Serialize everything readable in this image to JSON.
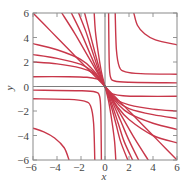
{
  "chart_data": {
    "type": "line",
    "title": "",
    "xlabel": "x",
    "ylabel": "y",
    "xlim": [
      -6,
      6
    ],
    "ylim": [
      -6,
      6
    ],
    "xticks": [
      -6,
      -4,
      -2,
      0,
      2,
      4,
      6
    ],
    "yticks": [
      -6,
      -4,
      -2,
      0,
      2,
      4,
      6
    ],
    "xtick_labels": [
      "−6",
      "−4",
      "−2",
      "0",
      "2",
      "4",
      "6"
    ],
    "ytick_labels": [
      "−6",
      "−4",
      "−2",
      "0",
      "2",
      "4",
      "6"
    ],
    "grid": false,
    "curve_color": "#c8374a",
    "axis_color": "#6e6e6e",
    "series": [
      {
        "name": "fan-q4-1",
        "points": [
          [
            0,
            0
          ],
          [
            0.3,
            -0.45
          ],
          [
            0.6,
            -0.6
          ],
          [
            1.5,
            -0.75
          ],
          [
            3,
            -0.8
          ],
          [
            6,
            -0.8
          ]
        ]
      },
      {
        "name": "fan-q4-2",
        "points": [
          [
            0,
            0
          ],
          [
            0.4,
            -0.5
          ],
          [
            1,
            -1.1
          ],
          [
            2,
            -1.5
          ],
          [
            4,
            -1.85
          ],
          [
            6,
            -2.0
          ]
        ]
      },
      {
        "name": "fan-q4-3",
        "points": [
          [
            0,
            0
          ],
          [
            0.4,
            -0.55
          ],
          [
            1,
            -1.2
          ],
          [
            2,
            -1.8
          ],
          [
            4,
            -2.3
          ],
          [
            6,
            -2.6
          ]
        ]
      },
      {
        "name": "fan-q4-4",
        "points": [
          [
            0,
            0
          ],
          [
            0.4,
            -0.6
          ],
          [
            1,
            -1.35
          ],
          [
            2,
            -2.2
          ],
          [
            4,
            -3.0
          ],
          [
            6,
            -3.5
          ]
        ]
      },
      {
        "name": "fan-q4-5",
        "points": [
          [
            0,
            0
          ],
          [
            0.5,
            -0.8
          ],
          [
            1,
            -1.6
          ],
          [
            2,
            -2.7
          ],
          [
            4,
            -4.0
          ],
          [
            6,
            -4.6
          ]
        ]
      },
      {
        "name": "fan-q4-6",
        "points": [
          [
            0,
            0
          ],
          [
            1,
            -1
          ],
          [
            2,
            -2
          ],
          [
            3,
            -3
          ],
          [
            4.5,
            -4.5
          ],
          [
            6,
            -6
          ]
        ]
      },
      {
        "name": "fan-q4-7",
        "points": [
          [
            0,
            0
          ],
          [
            0.5,
            -0.9
          ],
          [
            1.5,
            -2.6
          ],
          [
            2.5,
            -4.3
          ],
          [
            3.6,
            -6
          ]
        ]
      },
      {
        "name": "fan-q4-8",
        "points": [
          [
            0,
            0
          ],
          [
            0.5,
            -1.0
          ],
          [
            1.3,
            -2.8
          ],
          [
            2.0,
            -4.4
          ],
          [
            2.8,
            -6
          ]
        ]
      },
      {
        "name": "fan-q4-9",
        "points": [
          [
            0,
            0
          ],
          [
            0.45,
            -1.1
          ],
          [
            1.1,
            -3.0
          ],
          [
            1.6,
            -4.5
          ],
          [
            2.3,
            -6
          ]
        ]
      },
      {
        "name": "fan-q4-10",
        "points": [
          [
            0,
            0
          ],
          [
            0.4,
            -1.2
          ],
          [
            0.9,
            -3.0
          ],
          [
            1.3,
            -4.5
          ],
          [
            1.9,
            -6
          ]
        ]
      },
      {
        "name": "fan-q4-11",
        "points": [
          [
            0,
            0
          ],
          [
            0.3,
            -1.2
          ],
          [
            0.6,
            -3.0
          ],
          [
            0.8,
            -4.5
          ],
          [
            0.9,
            -6
          ]
        ]
      },
      {
        "name": "fan-q2-1",
        "points": [
          [
            0,
            0
          ],
          [
            -0.3,
            0.45
          ],
          [
            -0.6,
            0.6
          ],
          [
            -1.5,
            0.75
          ],
          [
            -3,
            0.8
          ],
          [
            -6,
            0.8
          ]
        ]
      },
      {
        "name": "fan-q2-2",
        "points": [
          [
            0,
            0
          ],
          [
            -0.4,
            0.5
          ],
          [
            -1,
            1.1
          ],
          [
            -2,
            1.5
          ],
          [
            -4,
            1.85
          ],
          [
            -6,
            2.0
          ]
        ]
      },
      {
        "name": "fan-q2-3",
        "points": [
          [
            0,
            0
          ],
          [
            -0.4,
            0.55
          ],
          [
            -1,
            1.2
          ],
          [
            -2,
            1.8
          ],
          [
            -4,
            2.3
          ],
          [
            -6,
            2.6
          ]
        ]
      },
      {
        "name": "fan-q2-4",
        "points": [
          [
            0,
            0
          ],
          [
            -0.4,
            0.6
          ],
          [
            -1,
            1.35
          ],
          [
            -2,
            2.2
          ],
          [
            -4,
            3.0
          ],
          [
            -6,
            3.5
          ]
        ]
      },
      {
        "name": "fan-q2-5",
        "points": [
          [
            0,
            0
          ],
          [
            -1,
            1
          ],
          [
            -2,
            2
          ],
          [
            -3,
            3
          ],
          [
            -4.5,
            4.5
          ],
          [
            -6,
            6
          ]
        ]
      },
      {
        "name": "fan-q2-6",
        "points": [
          [
            0,
            0
          ],
          [
            -0.5,
            0.9
          ],
          [
            -1.5,
            2.6
          ],
          [
            -2.5,
            4.3
          ],
          [
            -3.6,
            6
          ]
        ]
      },
      {
        "name": "fan-q2-7",
        "points": [
          [
            0,
            0
          ],
          [
            -0.5,
            1.0
          ],
          [
            -1.3,
            2.8
          ],
          [
            -2.0,
            4.4
          ],
          [
            -2.8,
            6
          ]
        ]
      },
      {
        "name": "fan-q2-8",
        "points": [
          [
            0,
            0
          ],
          [
            -0.45,
            1.1
          ],
          [
            -1.1,
            3.0
          ],
          [
            -1.6,
            4.5
          ],
          [
            -2.2,
            6
          ]
        ]
      },
      {
        "name": "fan-q2-9",
        "points": [
          [
            0,
            0
          ],
          [
            -0.4,
            1.2
          ],
          [
            -0.9,
            3.0
          ],
          [
            -1.3,
            4.5
          ],
          [
            -1.7,
            6
          ]
        ]
      },
      {
        "name": "fan-q2-10",
        "points": [
          [
            0,
            0
          ],
          [
            -0.3,
            1.2
          ],
          [
            -0.6,
            3.0
          ],
          [
            -0.8,
            4.5
          ],
          [
            -0.9,
            6
          ]
        ]
      },
      {
        "name": "hyp-q1-1",
        "points": [
          [
            0.3,
            6
          ],
          [
            0.35,
            2
          ],
          [
            0.45,
            0.8
          ],
          [
            0.8,
            0.45
          ],
          [
            2,
            0.35
          ],
          [
            6,
            0.3
          ]
        ]
      },
      {
        "name": "hyp-q1-2",
        "points": [
          [
            0.85,
            6
          ],
          [
            0.95,
            3
          ],
          [
            1.2,
            1.6
          ],
          [
            1.7,
            1.2
          ],
          [
            3,
            1.05
          ],
          [
            6,
            1.0
          ]
        ]
      },
      {
        "name": "hyp-q1-3",
        "points": [
          [
            2.4,
            6
          ],
          [
            2.7,
            5
          ],
          [
            3.3,
            4.3
          ],
          [
            4.2,
            3.8
          ],
          [
            6,
            3.4
          ]
        ]
      },
      {
        "name": "hyp-q3-1",
        "points": [
          [
            -0.3,
            -6
          ],
          [
            -0.35,
            -2
          ],
          [
            -0.45,
            -0.8
          ],
          [
            -0.8,
            -0.45
          ],
          [
            -2,
            -0.35
          ],
          [
            -6,
            -0.3
          ]
        ]
      },
      {
        "name": "hyp-q3-2",
        "points": [
          [
            -0.85,
            -6
          ],
          [
            -0.95,
            -3
          ],
          [
            -1.2,
            -1.6
          ],
          [
            -1.7,
            -1.2
          ],
          [
            -3,
            -1.05
          ],
          [
            -6,
            -1.0
          ]
        ]
      },
      {
        "name": "hyp-q3-3",
        "points": [
          [
            -3.0,
            -6
          ],
          [
            -3.4,
            -5
          ],
          [
            -4.2,
            -4.2
          ],
          [
            -5.1,
            -3.7
          ],
          [
            -6,
            -3.4
          ]
        ]
      }
    ]
  }
}
